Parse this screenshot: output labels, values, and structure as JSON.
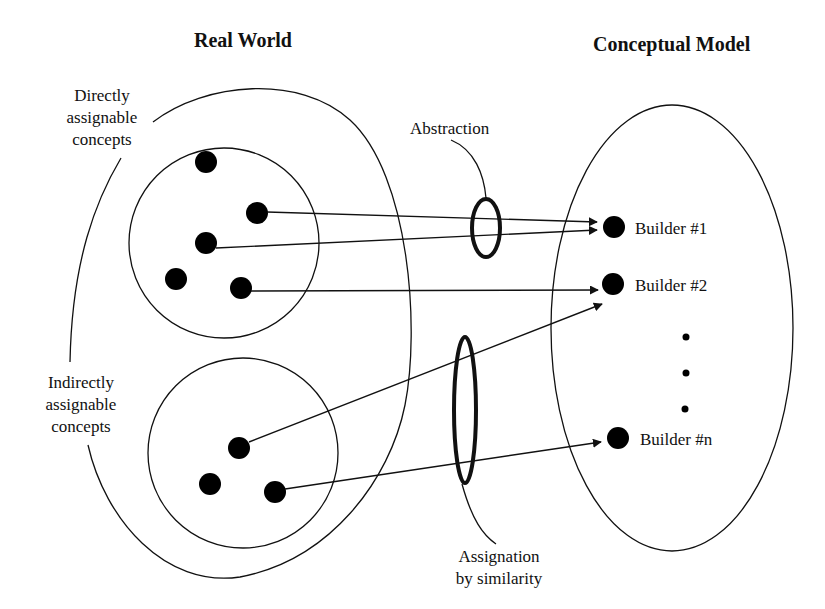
{
  "titles": {
    "left": "Real World",
    "right": "Conceptual Model"
  },
  "labels": {
    "directly": [
      "Directly",
      "assignable",
      "concepts"
    ],
    "indirectly": [
      "Indirectly",
      "assignable",
      "concepts"
    ],
    "abstraction": "Abstraction",
    "assignation": [
      "Assignation",
      "by similarity"
    ]
  },
  "builders": [
    {
      "label": "Builder #1"
    },
    {
      "label": "Builder #2"
    },
    {
      "label": "Builder #n"
    }
  ],
  "ellipsis_dots": 3,
  "colors": {
    "ink": "#111111",
    "background": "#ffffff"
  }
}
